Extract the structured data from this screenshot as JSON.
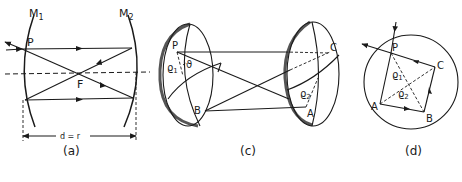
{
  "figure": {
    "panels": [
      {
        "id": "a",
        "caption": "(a)",
        "labels": {
          "mirror1": "M1",
          "mirror1_main": "M",
          "mirror1_sub": "1",
          "mirror2_main": "M",
          "mirror2_sub": "2",
          "point_p": "P",
          "focus": "F",
          "distance": "d = r"
        }
      },
      {
        "id": "c",
        "caption": "(c)",
        "labels": {
          "point_p": "P",
          "point_b": "B",
          "point_c": "C",
          "point_a": "A",
          "rho1_main": "ϱ",
          "rho1_sub": "1",
          "rho2_main": "ϱ",
          "rho2_sub": "2",
          "angle": "ϑ"
        }
      },
      {
        "id": "d",
        "caption": "(d)",
        "labels": {
          "point_p": "P",
          "point_c": "C",
          "point_a": "A",
          "point_b": "B",
          "rho1_main": "ϱ",
          "rho1_sub": "1",
          "rho2_main": "ϱ",
          "rho2_sub": "2"
        }
      }
    ]
  }
}
